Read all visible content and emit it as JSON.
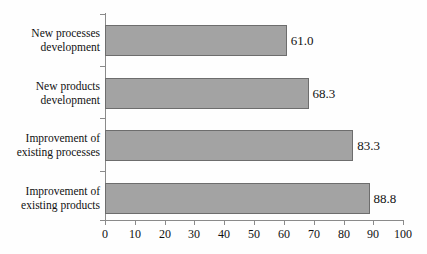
{
  "chart_data": {
    "type": "bar",
    "orientation": "horizontal",
    "title": "",
    "xlabel": "",
    "ylabel": "",
    "xlim": [
      0,
      100
    ],
    "grid": false,
    "legend": null,
    "categories": [
      "New processes development",
      "New products development",
      "Improvement of existing processes",
      "Improvement of existing products"
    ],
    "category_lines": [
      [
        "New processes",
        "development"
      ],
      [
        "New products",
        "development"
      ],
      [
        "Improvement of",
        "existing processes"
      ],
      [
        "Improvement of",
        "existing products"
      ]
    ],
    "values": [
      61.0,
      68.3,
      83.3,
      88.8
    ],
    "value_labels": [
      "61.0",
      "68.3",
      "83.3",
      "88.8"
    ],
    "xticks": [
      0,
      10,
      20,
      30,
      40,
      50,
      60,
      70,
      80,
      90,
      100
    ],
    "xtick_labels": [
      "0",
      "10",
      "20",
      "30",
      "40",
      "50",
      "60",
      "70",
      "80",
      "90",
      "100"
    ],
    "colors": {
      "bar_fill": "#a3a3a3",
      "bar_border": "#6d6d6d",
      "axis": "#8a8a8a",
      "text": "#111111",
      "background": "#fefefe"
    }
  }
}
